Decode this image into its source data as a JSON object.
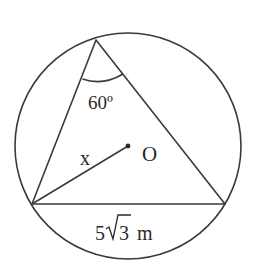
{
  "diagram": {
    "type": "geometry",
    "circle": {
      "cx": 128,
      "cy": 146,
      "r": 113,
      "center_label": "O"
    },
    "triangle": {
      "vertices": {
        "apex": [
          96,
          40
        ],
        "bottom_left": [
          32,
          204
        ],
        "bottom_right": [
          225,
          204
        ]
      }
    },
    "labels": {
      "angle": "60º",
      "radius": "x",
      "center": "O",
      "base_coefficient": "5",
      "base_radicand": "3",
      "base_unit": "m"
    },
    "stroke_color": "#3a3a3a"
  }
}
